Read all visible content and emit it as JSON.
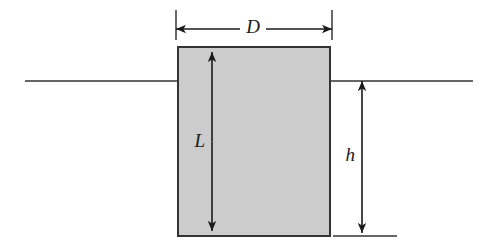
{
  "figure": {
    "type": "engineering-cross-section-diagram",
    "background_color": "#ffffff",
    "body": {
      "name": "rectangular-block",
      "shape": "rectangle",
      "x": 178,
      "y": 47,
      "width": 152,
      "height": 189,
      "fill_color": "#cccccc",
      "stroke_color": "#333333",
      "stroke_width": 2
    },
    "waterline": {
      "name": "free-surface-line",
      "y": 81,
      "stroke_color": "#333333",
      "stroke_width": 1.4,
      "left_segment": {
        "x1": 25,
        "x2": 178
      },
      "right_segment": {
        "x1": 330,
        "x2": 473
      }
    },
    "bottom_reference_line": {
      "name": "bottom-datum-line",
      "y": 236,
      "x1": 333,
      "x2": 397,
      "stroke_color": "#333333",
      "stroke_width": 1.4
    },
    "dimensions": [
      {
        "id": "D",
        "label": "D",
        "orientation": "horizontal",
        "meaning": "block width / diameter",
        "line_y": 29,
        "x1": 176,
        "x2": 332,
        "label_x": 253,
        "label_y": 29,
        "extension_ticks": [
          {
            "x": 176,
            "y1": 10,
            "y2": 40
          },
          {
            "x": 332,
            "y1": 10,
            "y2": 40
          }
        ],
        "arrowheads": "both",
        "stroke_color": "#1a1a1a"
      },
      {
        "id": "L",
        "label": "L",
        "orientation": "vertical",
        "meaning": "block height / length",
        "line_x": 212,
        "y1": 52,
        "y2": 231,
        "label_x": 205,
        "label_y": 143,
        "extension_ticks": [],
        "arrowheads": "both",
        "stroke_color": "#1a1a1a"
      },
      {
        "id": "h",
        "label": "h",
        "orientation": "vertical",
        "meaning": "submerged depth below free surface",
        "line_x": 362,
        "y1": 81,
        "y2": 233,
        "label_x": 355,
        "label_y": 157,
        "extension_ticks": [],
        "arrowheads": "both",
        "stroke_color": "#1a1a1a"
      }
    ]
  }
}
